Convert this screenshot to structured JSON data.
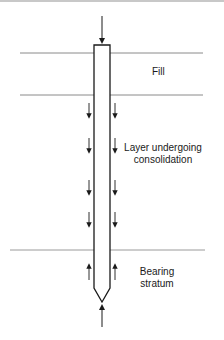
{
  "diagram": {
    "type": "pile-negative-skin-friction",
    "colors": {
      "stroke": "#1a1a1a",
      "layer_line": "#8a8a8a",
      "background": "#ffffff"
    },
    "layers": [
      {
        "name": "fill",
        "label_lines": [
          "Fill"
        ]
      },
      {
        "name": "consolidating-layer",
        "label_lines": [
          "Layer undergoing",
          "consolidation"
        ]
      },
      {
        "name": "bearing-stratum",
        "label_lines": [
          "Bearing",
          "stratum"
        ]
      }
    ],
    "forces": {
      "applied_load": "down",
      "consolidating_layer_skin_friction": "down",
      "bearing_stratum_skin_friction": "up",
      "end_bearing": "up"
    }
  }
}
